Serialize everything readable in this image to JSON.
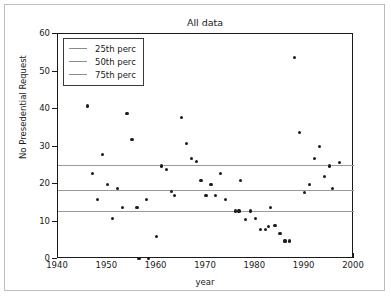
{
  "figure": {
    "title": "All data",
    "xlabel": "year",
    "ylabel": "No Presedential Request"
  },
  "legend": {
    "items": [
      {
        "label": "25th perc",
        "color": "#8a8a8a"
      },
      {
        "label": "50th perc",
        "color": "#8a8a8a"
      },
      {
        "label": "75th perc",
        "color": "#8a8a8a"
      }
    ]
  },
  "axes": {
    "x_ticks": [
      "1940",
      "1950",
      "1960",
      "1970",
      "1980",
      "1990",
      "2000"
    ],
    "y_ticks": [
      "0",
      "10",
      "20",
      "30",
      "40",
      "50",
      "60"
    ],
    "xlim": [
      1940,
      2000
    ],
    "ylim": [
      0,
      60
    ]
  },
  "chart_data": {
    "type": "scatter",
    "title": "All data",
    "xlabel": "year",
    "ylabel": "No Presedential Request",
    "xlim": [
      1940,
      2000
    ],
    "ylim": [
      0,
      60
    ],
    "grid": false,
    "legend_position": "upper left",
    "marker_color": "#1c1c1c",
    "points": [
      [
        1946,
        40.8
      ],
      [
        1947,
        22.8
      ],
      [
        1948,
        15.8
      ],
      [
        1949,
        27.8
      ],
      [
        1950,
        19.9
      ],
      [
        1951,
        10.9
      ],
      [
        1952,
        18.9
      ],
      [
        1953,
        13.8
      ],
      [
        1954,
        38.8
      ],
      [
        1955,
        31.9
      ],
      [
        1956,
        13.8
      ],
      [
        1956.4,
        0.1
      ],
      [
        1958,
        15.8
      ],
      [
        1958.3,
        0.1
      ],
      [
        1960,
        5.9
      ],
      [
        1961,
        24.8
      ],
      [
        1962,
        23.8
      ],
      [
        1963,
        17.9
      ],
      [
        1963.6,
        16.9
      ],
      [
        1965,
        37.8
      ],
      [
        1966,
        30.9
      ],
      [
        1967,
        26.9
      ],
      [
        1968,
        25.9
      ],
      [
        1969,
        20.9
      ],
      [
        1970,
        16.9
      ],
      [
        1971,
        19.9
      ],
      [
        1972,
        16.9
      ],
      [
        1973,
        22.8
      ],
      [
        1974,
        15.8
      ],
      [
        1976,
        12.8
      ],
      [
        1976.7,
        12.8
      ],
      [
        1977,
        20.9
      ],
      [
        1978,
        10.6
      ],
      [
        1979,
        12.8
      ],
      [
        1980,
        10.7
      ],
      [
        1981,
        7.8
      ],
      [
        1982,
        7.8
      ],
      [
        1982.6,
        8.6
      ],
      [
        1983,
        13.8
      ],
      [
        1984,
        8.9
      ],
      [
        1985,
        6.8
      ],
      [
        1986,
        4.8
      ],
      [
        1987,
        4.8
      ],
      [
        1988,
        53.8
      ],
      [
        1989,
        33.8
      ],
      [
        1990,
        17.8
      ],
      [
        1991,
        19.9
      ],
      [
        1992,
        26.8
      ],
      [
        1993,
        29.9
      ],
      [
        1994,
        21.9
      ],
      [
        1995,
        24.8
      ],
      [
        1995.6,
        18.9
      ],
      [
        1997,
        25.8
      ]
    ],
    "reference_lines": [
      {
        "name": "25th perc",
        "value": 25.0,
        "color": "#9a9a9a"
      },
      {
        "name": "50th perc",
        "value": 18.3,
        "color": "#9a9a9a"
      },
      {
        "name": "75th perc",
        "value": 12.8,
        "color": "#9a9a9a"
      }
    ]
  }
}
